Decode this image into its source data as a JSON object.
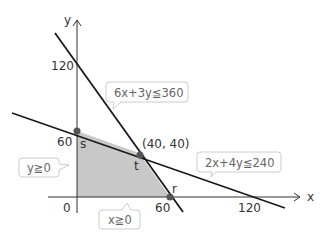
{
  "diagram": {
    "type": "linear-programming-feasible-region",
    "axes": {
      "x_label": "x",
      "y_label": "y",
      "origin_label": "0",
      "x_ticks": [
        "60",
        "120"
      ],
      "y_ticks": [
        "120",
        "60"
      ]
    },
    "constraints": [
      {
        "id": "c1",
        "label": "6x+3y≦360"
      },
      {
        "id": "c2",
        "label": "2x+4y≦240"
      },
      {
        "id": "c3",
        "label": "y≧0"
      },
      {
        "id": "c4",
        "label": "x≧0"
      }
    ],
    "points": {
      "s": {
        "label": "s",
        "x": 0,
        "y": 60
      },
      "t": {
        "label": "t",
        "x": 40,
        "y": 40,
        "coord_label": "(40, 40)"
      },
      "r": {
        "label": "r",
        "x": 60,
        "y": 0
      }
    },
    "colors": {
      "region_fill": "#c8c8c8",
      "line": "#1a1a1a",
      "axis": "#333333",
      "point": "#555555",
      "callout_border": "#cccccc",
      "callout_text": "#666666"
    }
  }
}
